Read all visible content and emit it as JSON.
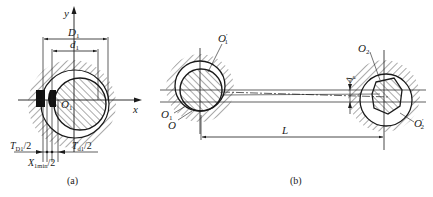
{
  "figure_a": {
    "caption": "(a)",
    "axis_x": "x",
    "axis_y": "y",
    "dim_outer": "D",
    "dim_outer_sub": "1",
    "dim_inner": "d",
    "dim_inner_sub": "1",
    "center": "O",
    "center_sub": "1",
    "tol_hole": "T",
    "tol_hole_sub": "D1",
    "tol_hole_suffix": "/2",
    "tol_shaft": "T",
    "tol_shaft_sub": "d1",
    "tol_shaft_suffix": "/2",
    "clearance": "X",
    "clearance_sub": "1min",
    "clearance_suffix": "/2"
  },
  "figure_b": {
    "caption": "(b)",
    "o1_prime": "O",
    "o1_prime_sub": "1",
    "o1_prime_mark": "′",
    "o1": "O",
    "o1_sub": "1",
    "o": "O",
    "o2": "O",
    "o2_sub": "2",
    "o2_prime": "O",
    "o2_prime_sub": "2",
    "o2_prime_mark": "′",
    "distance": "L",
    "delta": "Δ",
    "delta_sub": "e"
  },
  "colors": {
    "ink": "#1a1a1a",
    "hatch": "#2a2a2a",
    "background": "#ffffff"
  }
}
